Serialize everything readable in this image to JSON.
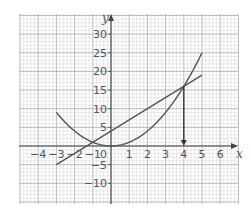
{
  "chart_data": {
    "type": "line",
    "title": "",
    "xlabel": "x",
    "ylabel": "y",
    "xlim": [
      -5,
      7
    ],
    "ylim": [
      -15,
      34
    ],
    "grid": true,
    "x_ticks": [
      -4,
      -3,
      -2,
      -1,
      1,
      2,
      3,
      4,
      5,
      6
    ],
    "x_tick_labels": [
      "−4",
      "−3",
      "−2",
      "−1",
      "1",
      "2",
      "3",
      "4",
      "5",
      "6"
    ],
    "y_ticks": [
      30,
      25,
      20,
      15,
      10,
      5,
      -5,
      -10
    ],
    "y_tick_labels": [
      "30",
      "25",
      "20",
      "15",
      "10",
      "5",
      "−5",
      "−10"
    ],
    "origin_label": "0",
    "series": [
      {
        "name": "y = x²",
        "kind": "curve",
        "x_range": [
          -3,
          5
        ],
        "x": [
          -3,
          -2,
          -1,
          0,
          1,
          2,
          3,
          4,
          5
        ],
        "values": [
          9,
          4,
          1,
          0,
          1,
          4,
          9,
          16,
          25
        ]
      },
      {
        "name": "y = 3x + 4",
        "kind": "line",
        "x_range": [
          -3,
          5
        ],
        "x": [
          -3,
          5
        ],
        "values": [
          -5,
          19
        ]
      }
    ],
    "intersections": [
      {
        "x": -1,
        "y": 1
      },
      {
        "x": 4,
        "y": 16
      }
    ],
    "annotations": [
      {
        "type": "arrow",
        "from": [
          4,
          16
        ],
        "to": [
          4,
          0
        ],
        "description": "arrow down from intersection to x-axis at x = 4"
      }
    ]
  },
  "colors": {
    "grid_minor": "#d4d4d4",
    "grid_major": "#a8a8a8",
    "axis": "#444444",
    "curve": "#555555",
    "text": "#555555"
  }
}
